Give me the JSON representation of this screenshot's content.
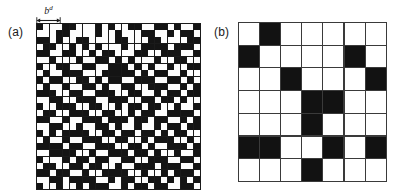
{
  "figure": {
    "caption_parts": {
      "panel_a_label": "(a)",
      "panel_b_label": "(b)"
    },
    "box_size_label": "b",
    "box_size_superscript": "d",
    "arrow_icon": "double-headed-arrow-icon"
  },
  "chart_data": {
    "type": "heatmap",
    "title": "",
    "xlabel": "",
    "ylabel": "",
    "colors": {
      "occupied": "#141414",
      "empty": "#fdfdfd",
      "gridline": "#1a1a1a"
    },
    "panels": [
      {
        "label": "(a)",
        "description": "fine square lattice of occupied (black) and empty (white) sites",
        "rows": 25,
        "cols": 25,
        "annotation": {
          "text": "b",
          "superscript": "d",
          "spans_cells": 4,
          "position": "top-left, above grid"
        },
        "matrix": [
          [
            1,
            0,
            0,
            0,
            1,
            1,
            0,
            0,
            0,
            1,
            0,
            1,
            0,
            0,
            1,
            1,
            0,
            0,
            1,
            1,
            0,
            1,
            0,
            0,
            1
          ],
          [
            0,
            0,
            0,
            1,
            1,
            0,
            0,
            0,
            0,
            1,
            0,
            0,
            1,
            0,
            0,
            0,
            1,
            1,
            0,
            0,
            1,
            0,
            1,
            1,
            0
          ],
          [
            1,
            1,
            0,
            1,
            0,
            0,
            1,
            1,
            0,
            0,
            0,
            0,
            1,
            1,
            0,
            0,
            0,
            1,
            1,
            0,
            0,
            0,
            0,
            1,
            1
          ],
          [
            0,
            1,
            1,
            0,
            0,
            1,
            0,
            1,
            0,
            1,
            0,
            0,
            0,
            1,
            0,
            0,
            1,
            1,
            1,
            1,
            0,
            1,
            1,
            1,
            0
          ],
          [
            1,
            1,
            0,
            0,
            1,
            1,
            0,
            0,
            1,
            0,
            1,
            1,
            0,
            0,
            0,
            1,
            1,
            0,
            0,
            1,
            1,
            1,
            0,
            0,
            1
          ],
          [
            0,
            0,
            1,
            0,
            0,
            0,
            1,
            0,
            0,
            1,
            1,
            0,
            1,
            0,
            1,
            0,
            0,
            0,
            1,
            0,
            0,
            1,
            1,
            0,
            0
          ],
          [
            1,
            0,
            0,
            1,
            1,
            0,
            0,
            1,
            1,
            0,
            0,
            1,
            1,
            1,
            0,
            1,
            0,
            1,
            0,
            0,
            1,
            0,
            0,
            1,
            1
          ],
          [
            0,
            1,
            0,
            0,
            1,
            1,
            1,
            0,
            0,
            0,
            1,
            1,
            1,
            1,
            1,
            0,
            1,
            0,
            1,
            1,
            0,
            0,
            1,
            0,
            0
          ],
          [
            1,
            0,
            1,
            1,
            0,
            0,
            1,
            1,
            0,
            1,
            0,
            1,
            1,
            0,
            0,
            1,
            1,
            1,
            0,
            0,
            1,
            1,
            0,
            1,
            0
          ],
          [
            0,
            1,
            0,
            0,
            1,
            0,
            0,
            1,
            1,
            0,
            1,
            0,
            0,
            1,
            1,
            0,
            0,
            1,
            1,
            1,
            0,
            0,
            1,
            0,
            1
          ],
          [
            1,
            1,
            1,
            0,
            0,
            1,
            1,
            0,
            0,
            1,
            1,
            1,
            0,
            0,
            1,
            1,
            0,
            0,
            1,
            0,
            1,
            1,
            0,
            1,
            1
          ],
          [
            0,
            0,
            1,
            1,
            0,
            0,
            1,
            1,
            1,
            0,
            0,
            1,
            1,
            1,
            0,
            0,
            1,
            1,
            0,
            1,
            1,
            0,
            1,
            0,
            0
          ],
          [
            1,
            0,
            0,
            1,
            1,
            1,
            0,
            0,
            1,
            1,
            0,
            0,
            1,
            0,
            1,
            1,
            0,
            1,
            1,
            0,
            0,
            1,
            0,
            0,
            1
          ],
          [
            0,
            1,
            1,
            0,
            0,
            1,
            1,
            1,
            0,
            0,
            1,
            1,
            0,
            0,
            1,
            0,
            1,
            1,
            0,
            0,
            1,
            1,
            1,
            1,
            0
          ],
          [
            1,
            1,
            0,
            0,
            1,
            0,
            0,
            1,
            1,
            1,
            0,
            1,
            1,
            1,
            0,
            1,
            1,
            0,
            1,
            1,
            0,
            0,
            1,
            0,
            1
          ],
          [
            0,
            0,
            1,
            1,
            0,
            0,
            1,
            0,
            0,
            1,
            1,
            0,
            1,
            0,
            0,
            1,
            0,
            0,
            1,
            0,
            1,
            1,
            0,
            1,
            1
          ],
          [
            1,
            0,
            1,
            0,
            1,
            1,
            1,
            1,
            0,
            0,
            1,
            1,
            0,
            1,
            1,
            0,
            1,
            1,
            0,
            1,
            0,
            1,
            1,
            0,
            0
          ],
          [
            0,
            1,
            0,
            0,
            1,
            0,
            0,
            1,
            1,
            1,
            0,
            0,
            1,
            1,
            0,
            0,
            1,
            0,
            1,
            1,
            1,
            0,
            0,
            1,
            0
          ],
          [
            1,
            1,
            1,
            1,
            0,
            1,
            1,
            0,
            0,
            1,
            1,
            1,
            0,
            0,
            1,
            1,
            0,
            1,
            0,
            0,
            1,
            1,
            1,
            0,
            1
          ],
          [
            0,
            0,
            1,
            1,
            1,
            1,
            0,
            0,
            1,
            0,
            0,
            1,
            1,
            1,
            0,
            1,
            1,
            0,
            1,
            0,
            0,
            1,
            0,
            0,
            1
          ],
          [
            1,
            0,
            0,
            0,
            1,
            0,
            1,
            1,
            0,
            1,
            1,
            0,
            0,
            1,
            1,
            0,
            0,
            1,
            1,
            1,
            0,
            0,
            1,
            1,
            0
          ],
          [
            0,
            1,
            1,
            0,
            0,
            1,
            1,
            0,
            1,
            1,
            0,
            0,
            1,
            0,
            0,
            1,
            1,
            1,
            0,
            1,
            1,
            1,
            0,
            0,
            1
          ],
          [
            1,
            1,
            0,
            1,
            1,
            0,
            0,
            1,
            0,
            0,
            1,
            1,
            1,
            1,
            0,
            0,
            1,
            0,
            0,
            1,
            0,
            1,
            1,
            1,
            0
          ],
          [
            0,
            0,
            1,
            1,
            0,
            1,
            1,
            1,
            1,
            0,
            0,
            1,
            0,
            1,
            1,
            0,
            0,
            1,
            1,
            0,
            1,
            0,
            1,
            0,
            1
          ],
          [
            1,
            0,
            0,
            1,
            0,
            0,
            1,
            0,
            1,
            1,
            1,
            0,
            0,
            1,
            0,
            1,
            1,
            0,
            1,
            1,
            0,
            0,
            1,
            1,
            0
          ]
        ]
      },
      {
        "label": "(b)",
        "description": "coarse-grained lattice after box renormalization with boxes of linear size b",
        "rows": 7,
        "cols": 7,
        "matrix": [
          [
            0,
            1,
            0,
            0,
            0,
            0,
            0
          ],
          [
            1,
            0,
            0,
            0,
            0,
            1,
            0
          ],
          [
            0,
            0,
            1,
            0,
            0,
            0,
            1
          ],
          [
            0,
            0,
            0,
            1,
            1,
            0,
            0
          ],
          [
            0,
            0,
            0,
            1,
            0,
            0,
            0
          ],
          [
            1,
            1,
            0,
            0,
            1,
            0,
            1
          ],
          [
            0,
            0,
            0,
            1,
            0,
            0,
            0
          ]
        ]
      }
    ]
  }
}
